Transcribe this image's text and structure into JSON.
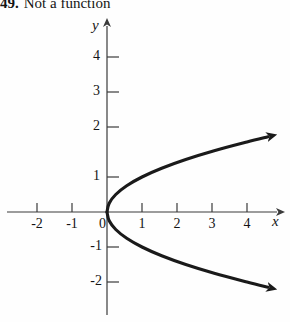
{
  "caption": {
    "number": "49.",
    "text": "Not a function"
  },
  "colors": {
    "ink": "#141414",
    "axis": "#3a3a3a",
    "curve": "#1a1a1a",
    "background": "#fefefe"
  },
  "axis_labels": {
    "x": "x",
    "y": "y"
  },
  "chart_data": {
    "type": "line",
    "title": "",
    "subtitle": "",
    "xlabel": "x",
    "ylabel": "y",
    "xlim": [
      -2.6,
      5.1
    ],
    "ylim": [
      -3.1,
      4.8
    ],
    "grid": false,
    "legend": null,
    "relation": "x = y^2",
    "x_ticks": [
      -2,
      -1,
      0,
      1,
      2,
      3,
      4
    ],
    "x_tick_labels": [
      "-2",
      "-1",
      "0",
      "1",
      "2",
      "3",
      "4"
    ],
    "y_ticks": [
      -2,
      -1,
      1,
      2,
      3,
      4
    ],
    "y_tick_labels": [
      "-2",
      "-1",
      "1",
      "2",
      "3",
      "4"
    ],
    "origin_label": "0",
    "series": [
      {
        "name": "x = y squared",
        "arrow_start": false,
        "arrow_end": true,
        "points": [
          [
            0,
            0
          ],
          [
            0.0625,
            0.25
          ],
          [
            0.25,
            0.5
          ],
          [
            0.5625,
            0.75
          ],
          [
            1,
            1
          ],
          [
            1.5625,
            1.25
          ],
          [
            2.25,
            1.5
          ],
          [
            3.0625,
            1.75
          ],
          [
            4,
            2
          ],
          [
            4.6,
            2.15
          ]
        ]
      },
      {
        "name": "x = y squared (lower branch)",
        "arrow_start": false,
        "arrow_end": true,
        "points": [
          [
            0,
            0
          ],
          [
            0.0625,
            -0.25
          ],
          [
            0.25,
            -0.5
          ],
          [
            0.5625,
            -0.75
          ],
          [
            1,
            -1
          ],
          [
            1.5625,
            -1.25
          ],
          [
            2.25,
            -1.5
          ],
          [
            3.0625,
            -1.75
          ],
          [
            4,
            -2
          ],
          [
            4.6,
            -2.15
          ]
        ]
      }
    ]
  }
}
